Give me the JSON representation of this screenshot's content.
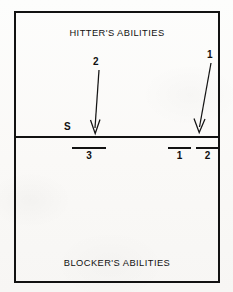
{
  "figure": {
    "type": "annotated-court-diagram",
    "background_color": "#fbfbf9",
    "ink_color": "#121212",
    "width": 233,
    "height": 292
  },
  "upper_zone": {
    "caption": "HITTER'S ABILITIES",
    "arrows": [
      {
        "id": "arrow-2",
        "label": "2",
        "direction": "down",
        "tail_x": 99,
        "tail_y": 68,
        "tip_x": 95,
        "tip_y": 135
      },
      {
        "id": "arrow-1",
        "label": "1",
        "direction": "down",
        "tail_x": 211,
        "tail_y": 62,
        "tip_x": 199,
        "tip_y": 134
      }
    ],
    "side_label": "S"
  },
  "lower_zone": {
    "caption": "BLOCKER'S ABILITIES",
    "segments": [
      {
        "id": "segment-3",
        "label": "3",
        "x": 72,
        "width": 34
      },
      {
        "id": "segment-1",
        "label": "1",
        "x": 168,
        "width": 23
      },
      {
        "id": "segment-2",
        "label": "2",
        "x": 196,
        "width": 23
      }
    ]
  }
}
